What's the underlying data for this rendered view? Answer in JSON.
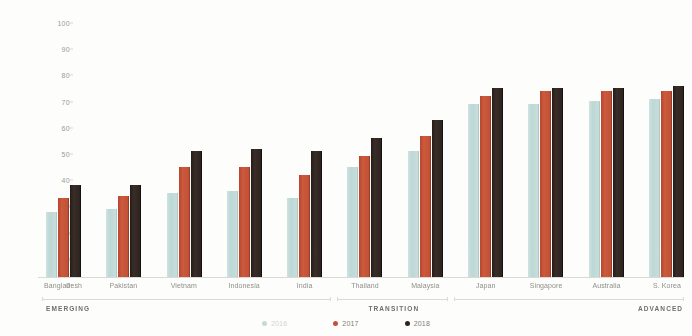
{
  "chart_data": {
    "type": "bar",
    "title": "",
    "xlabel": "",
    "ylabel": "",
    "ylim": [
      0,
      100
    ],
    "yticks": [
      100,
      90,
      80,
      70,
      60,
      50,
      40,
      30,
      20,
      10,
      0
    ],
    "grid": false,
    "legend_position": "bottom",
    "categories": [
      "Bangladesh",
      "Pakistan",
      "Vietnam",
      "Indonesia",
      "India",
      "Thailand",
      "Malaysia",
      "Japan",
      "Singapore",
      "Australia",
      "S. Korea"
    ],
    "series": [
      {
        "name": "2016",
        "color": "#c2dbd9",
        "values": [
          25,
          26,
          32,
          33,
          30,
          42,
          48,
          66,
          66,
          67,
          68
        ]
      },
      {
        "name": "2017",
        "color": "#c4503a",
        "values": [
          30,
          31,
          42,
          42,
          39,
          46,
          54,
          69,
          71,
          71,
          71
        ]
      },
      {
        "name": "2018",
        "color": "#2c2320",
        "values": [
          35,
          35,
          48,
          49,
          48,
          53,
          60,
          72,
          72,
          72,
          73
        ]
      }
    ],
    "group_brackets": [
      {
        "label": "EMERGING",
        "from": "Bangladesh",
        "to": "India"
      },
      {
        "label": "TRANSITION",
        "from": "Thailand",
        "to": "Malaysia"
      },
      {
        "label": "ADVANCED",
        "from": "Japan",
        "to": "S. Korea"
      }
    ]
  }
}
